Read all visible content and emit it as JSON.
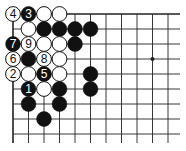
{
  "diagram": {
    "type": "go-board-partial",
    "visible_columns": 11,
    "visible_rows": 9,
    "edges": [
      "top",
      "left"
    ],
    "origin_px": {
      "x": 13,
      "y": 14
    },
    "spacing_px": {
      "x": 15.5,
      "y": 15
    },
    "line_extent_px": {
      "right": 180,
      "bottom": 143
    },
    "colors": {
      "line": "#222222",
      "black_stone": "#111111",
      "white_stone": "#ffffff",
      "stone_outline": "#111111"
    },
    "star_points": [
      {
        "col": 9,
        "row": 3
      }
    ],
    "stones": [
      {
        "col": 0,
        "row": 0,
        "color": "white",
        "label": "4"
      },
      {
        "col": 1,
        "row": 0,
        "color": "black",
        "label": "3"
      },
      {
        "col": 2,
        "row": 0,
        "color": "white",
        "label": ""
      },
      {
        "col": 3,
        "row": 0,
        "color": "white",
        "label": ""
      },
      {
        "col": 1,
        "row": 1,
        "color": "white",
        "label": ""
      },
      {
        "col": 2,
        "row": 1,
        "color": "black",
        "label": ""
      },
      {
        "col": 3,
        "row": 1,
        "color": "black",
        "label": ""
      },
      {
        "col": 4,
        "row": 1,
        "color": "black",
        "label": ""
      },
      {
        "col": 5,
        "row": 1,
        "color": "black",
        "label": ""
      },
      {
        "col": 0,
        "row": 2,
        "color": "black",
        "label": "7"
      },
      {
        "col": 1,
        "row": 2,
        "color": "white",
        "label": "9"
      },
      {
        "col": 2,
        "row": 2,
        "color": "white",
        "label": ""
      },
      {
        "col": 3,
        "row": 2,
        "color": "white",
        "label": ""
      },
      {
        "col": 4,
        "row": 2,
        "color": "black",
        "label": ""
      },
      {
        "col": 0,
        "row": 3,
        "color": "white",
        "label": "6"
      },
      {
        "col": 1,
        "row": 3,
        "color": "black",
        "label": ""
      },
      {
        "col": 2,
        "row": 3,
        "color": "white",
        "label": "8"
      },
      {
        "col": 3,
        "row": 3,
        "color": "white",
        "label": ""
      },
      {
        "col": 0,
        "row": 4,
        "color": "white",
        "label": "2"
      },
      {
        "col": 1,
        "row": 4,
        "color": "white",
        "label": ""
      },
      {
        "col": 2,
        "row": 4,
        "color": "black",
        "label": "5"
      },
      {
        "col": 3,
        "row": 4,
        "color": "white",
        "label": ""
      },
      {
        "col": 5,
        "row": 4,
        "color": "black",
        "label": ""
      },
      {
        "col": 1,
        "row": 5,
        "color": "black",
        "label": "1"
      },
      {
        "col": 2,
        "row": 5,
        "color": "white",
        "label": ""
      },
      {
        "col": 3,
        "row": 5,
        "color": "black",
        "label": ""
      },
      {
        "col": 5,
        "row": 5,
        "color": "black",
        "label": ""
      },
      {
        "col": 1,
        "row": 6,
        "color": "black",
        "label": ""
      },
      {
        "col": 3,
        "row": 6,
        "color": "black",
        "label": ""
      },
      {
        "col": 2,
        "row": 7,
        "color": "black",
        "label": ""
      }
    ]
  }
}
